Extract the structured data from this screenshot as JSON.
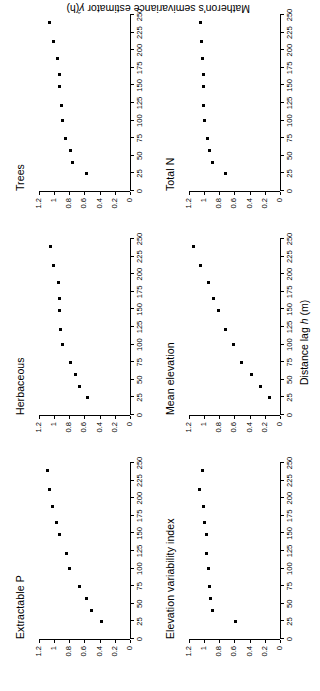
{
  "figure": {
    "orientation": "rotated-90-ccw",
    "background": "#ffffff",
    "point_color": "#000000",
    "axis_color": "#000000",
    "x_axis_title_main": "Distance lag ",
    "x_axis_title_var": "h",
    "x_axis_title_unit": " (m)",
    "y_axis_title_main": "Matheron's semivariance estimator ",
    "y_axis_title_var": "γ̂",
    "y_axis_title_arg": "(h)"
  },
  "axes": {
    "x_ticks": [
      0,
      25,
      50,
      75,
      100,
      125,
      150,
      175,
      200,
      225,
      250
    ],
    "x_tick_labels": [
      "0",
      "25",
      "50",
      "75",
      "100",
      "125",
      "150",
      "175",
      "200",
      "225",
      "250"
    ],
    "x_min": 0,
    "x_max": 250,
    "y_ticks": [
      0,
      0.2,
      0.4,
      0.6,
      0.8,
      1.0,
      1.2
    ],
    "y_tick_labels": [
      "0",
      "0.2",
      "0.4",
      "0.6",
      "0.8",
      "1",
      "1.2"
    ],
    "y_min": 0,
    "y_max": 1.26
  },
  "chart_data": [
    {
      "type": "scatter",
      "title": "Extractable P",
      "xlabel": "Distance lag h (m)",
      "ylabel": "Matheron's semivariance estimator γ̂(h)",
      "xlim": [
        0,
        250
      ],
      "ylim": [
        0,
        1.26
      ],
      "grid": false,
      "legend": "none",
      "x": [
        25,
        40,
        57,
        75,
        100,
        122,
        148,
        165,
        188,
        213,
        240
      ],
      "values": [
        0.38,
        0.5,
        0.57,
        0.66,
        0.79,
        0.84,
        0.92,
        0.96,
        1.02,
        1.06,
        1.08
      ]
    },
    {
      "type": "scatter",
      "title": "Elevation variability index",
      "xlabel": "Distance lag h (m)",
      "ylabel": "Matheron's semivariance estimator γ̂(h)",
      "xlim": [
        0,
        250
      ],
      "ylim": [
        0,
        1.26
      ],
      "grid": false,
      "legend": "none",
      "x": [
        25,
        40,
        57,
        75,
        100,
        122,
        148,
        165,
        188,
        213,
        240
      ],
      "values": [
        0.59,
        0.89,
        0.91,
        0.92,
        0.94,
        0.97,
        0.96,
        0.99,
        1.0,
        1.06,
        1.02
      ]
    },
    {
      "type": "scatter",
      "title": "Herbaceous",
      "xlabel": "Distance lag h (m)",
      "ylabel": "Matheron's semivariance estimator γ̂(h)",
      "xlim": [
        0,
        250
      ],
      "ylim": [
        0,
        1.26
      ],
      "grid": false,
      "legend": "none",
      "x": [
        25,
        40,
        57,
        75,
        100,
        122,
        148,
        165,
        188,
        213,
        240
      ],
      "values": [
        0.56,
        0.66,
        0.71,
        0.78,
        0.88,
        0.91,
        0.92,
        0.93,
        0.94,
        1.0,
        1.04
      ]
    },
    {
      "type": "scatter",
      "title": "Mean elevation",
      "xlabel": "Distance lag h (m)",
      "ylabel": "Matheron's semivariance estimator γ̂(h)",
      "xlim": [
        0,
        250
      ],
      "ylim": [
        0,
        1.26
      ],
      "grid": false,
      "legend": "none",
      "x": [
        25,
        40,
        57,
        75,
        100,
        122,
        148,
        165,
        188,
        213,
        240
      ],
      "values": [
        0.14,
        0.26,
        0.37,
        0.5,
        0.61,
        0.72,
        0.81,
        0.87,
        0.94,
        1.04,
        1.13
      ]
    },
    {
      "type": "scatter",
      "title": "Trees",
      "xlabel": "Distance lag h (m)",
      "ylabel": "Matheron's semivariance estimator γ̂(h)",
      "xlim": [
        0,
        250
      ],
      "ylim": [
        0,
        1.26
      ],
      "grid": false,
      "legend": "none",
      "x": [
        25,
        40,
        57,
        75,
        100,
        122,
        148,
        165,
        188,
        213,
        240
      ],
      "values": [
        0.57,
        0.76,
        0.78,
        0.85,
        0.88,
        0.9,
        0.92,
        0.93,
        0.95,
        1.01,
        1.06
      ]
    },
    {
      "type": "scatter",
      "title": "Total N",
      "xlabel": "Distance lag h (m)",
      "ylabel": "Matheron's semivariance estimator γ̂(h)",
      "xlim": [
        0,
        250
      ],
      "ylim": [
        0,
        1.26
      ],
      "grid": false,
      "legend": "none",
      "x": [
        25,
        40,
        57,
        75,
        100,
        122,
        148,
        165,
        188,
        213,
        240
      ],
      "values": [
        0.72,
        0.88,
        0.92,
        0.95,
        0.99,
        1.0,
        1.0,
        1.01,
        1.02,
        1.03,
        1.04
      ]
    }
  ],
  "panels": [
    {
      "id": "extractable-p",
      "title": "Extractable P",
      "row": 0,
      "col": 0,
      "chart_index": 0
    },
    {
      "id": "herbaceous",
      "title": "Herbaceous",
      "row": 0,
      "col": 1,
      "chart_index": 2
    },
    {
      "id": "trees",
      "title": "Trees",
      "row": 0,
      "col": 2,
      "chart_index": 4
    },
    {
      "id": "elevation-variability-index",
      "title": "Elevation variability index",
      "row": 1,
      "col": 0,
      "chart_index": 1
    },
    {
      "id": "mean-elevation",
      "title": "Mean elevation",
      "row": 1,
      "col": 1,
      "chart_index": 3
    },
    {
      "id": "total-n",
      "title": "Total N",
      "row": 1,
      "col": 2,
      "chart_index": 5
    }
  ]
}
